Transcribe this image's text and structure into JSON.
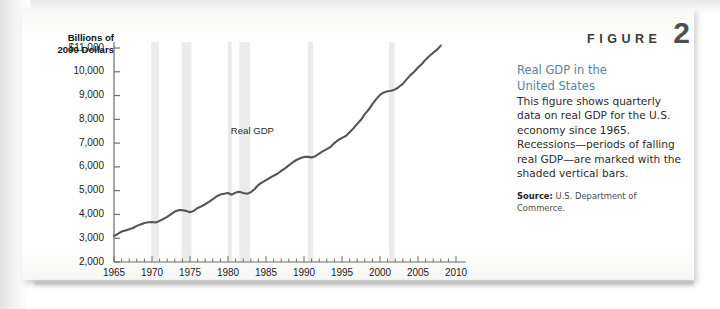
{
  "figure": {
    "word": "FIGURE",
    "number": "2"
  },
  "caption": {
    "title_line1": "Real GDP in the",
    "title_line2": "United States",
    "body": "This figure shows quarterly data on real GDP for the U.S. economy since 1965. Recessions—periods of falling real GDP—are marked with the shaded vertical bars.",
    "source_label": "Source:",
    "source_text": " U.S. Department of Commerce."
  },
  "colors": {
    "caption_title": "#5a8494",
    "line": "#555555",
    "recession_bar": "#ebebeb",
    "axis": "#6e6e6e",
    "card_background": "#fdfdfc"
  },
  "chart_data": {
    "type": "line",
    "title": "Real GDP in the United States",
    "xlabel": "",
    "ylabel": "Billions of 2000 Dollars",
    "axis_title_line1": "Billions of",
    "axis_title_line2": "2000 Dollars",
    "series_annotation": "Real GDP",
    "annotation_x": 1988.0,
    "annotation_y": 7450,
    "xlim": [
      1965,
      2010
    ],
    "ylim": [
      2000,
      11000
    ],
    "xticks": [
      1965,
      1970,
      1975,
      1980,
      1985,
      1990,
      1995,
      2000,
      2005,
      2010
    ],
    "xtick_labels": [
      "1965",
      "1970",
      "1975",
      "1980",
      "1985",
      "1990",
      "1995",
      "2000",
      "2005",
      "2010"
    ],
    "xminor_step": 1,
    "yticks": [
      2000,
      3000,
      4000,
      5000,
      6000,
      7000,
      8000,
      9000,
      10000,
      11000
    ],
    "ytick_labels": [
      "2,000",
      "3,000",
      "4,000",
      "5,000",
      "6,000",
      "7,000",
      "8,000",
      "9,000",
      "10,000",
      "$11,000"
    ],
    "grid": false,
    "legend": "none",
    "recession_bands": [
      {
        "start": 1969.9,
        "end": 1970.9
      },
      {
        "start": 1973.9,
        "end": 1975.2
      },
      {
        "start": 1980.0,
        "end": 1980.5
      },
      {
        "start": 1981.5,
        "end": 1982.9
      },
      {
        "start": 1990.5,
        "end": 1991.2
      },
      {
        "start": 2001.2,
        "end": 2001.9
      }
    ],
    "x": [
      1965.0,
      1965.5,
      1966.0,
      1966.5,
      1967.0,
      1967.5,
      1968.0,
      1968.5,
      1969.0,
      1969.5,
      1970.0,
      1970.5,
      1971.0,
      1971.5,
      1972.0,
      1972.5,
      1973.0,
      1973.5,
      1974.0,
      1974.5,
      1975.0,
      1975.5,
      1976.0,
      1976.5,
      1977.0,
      1977.5,
      1978.0,
      1978.5,
      1979.0,
      1979.5,
      1980.0,
      1980.5,
      1981.0,
      1981.5,
      1982.0,
      1982.5,
      1983.0,
      1983.5,
      1984.0,
      1984.5,
      1985.0,
      1985.5,
      1986.0,
      1986.5,
      1987.0,
      1987.5,
      1988.0,
      1988.5,
      1989.0,
      1989.5,
      1990.0,
      1990.5,
      1991.0,
      1991.5,
      1992.0,
      1992.5,
      1993.0,
      1993.5,
      1994.0,
      1994.5,
      1995.0,
      1995.5,
      1996.0,
      1996.5,
      1997.0,
      1997.5,
      1998.0,
      1998.5,
      1999.0,
      1999.5,
      2000.0,
      2000.5,
      2001.0,
      2001.5,
      2002.0,
      2002.5,
      2003.0,
      2003.5,
      2004.0,
      2004.5,
      2005.0,
      2005.5,
      2006.0,
      2006.5,
      2007.0,
      2007.5,
      2008.0
    ],
    "y": [
      3100,
      3180,
      3280,
      3330,
      3380,
      3430,
      3520,
      3580,
      3640,
      3670,
      3680,
      3660,
      3730,
      3810,
      3900,
      4010,
      4120,
      4180,
      4180,
      4150,
      4090,
      4150,
      4270,
      4340,
      4430,
      4530,
      4640,
      4760,
      4840,
      4870,
      4900,
      4830,
      4920,
      4950,
      4900,
      4870,
      4930,
      5070,
      5240,
      5350,
      5440,
      5540,
      5630,
      5710,
      5830,
      5940,
      6060,
      6190,
      6290,
      6360,
      6420,
      6420,
      6400,
      6450,
      6560,
      6660,
      6750,
      6840,
      7000,
      7130,
      7220,
      7300,
      7460,
      7620,
      7810,
      7980,
      8220,
      8400,
      8640,
      8850,
      9030,
      9130,
      9180,
      9200,
      9260,
      9370,
      9490,
      9680,
      9860,
      10000,
      10180,
      10330,
      10510,
      10660,
      10800,
      10930,
      11100
    ]
  }
}
